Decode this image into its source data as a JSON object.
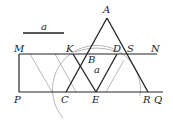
{
  "diagram": {
    "type": "geometry-construction",
    "segment_label": "a",
    "rhombus_label": "a",
    "points": {
      "A": "A",
      "M": "M",
      "K": "K",
      "D": "D",
      "S": "S",
      "N": "N",
      "B": "B",
      "P": "P",
      "C": "C",
      "E": "E",
      "R": "R",
      "Q": "Q"
    },
    "colors": {
      "line": "#222222",
      "thin": "#777777",
      "background": "#ffffff"
    }
  }
}
